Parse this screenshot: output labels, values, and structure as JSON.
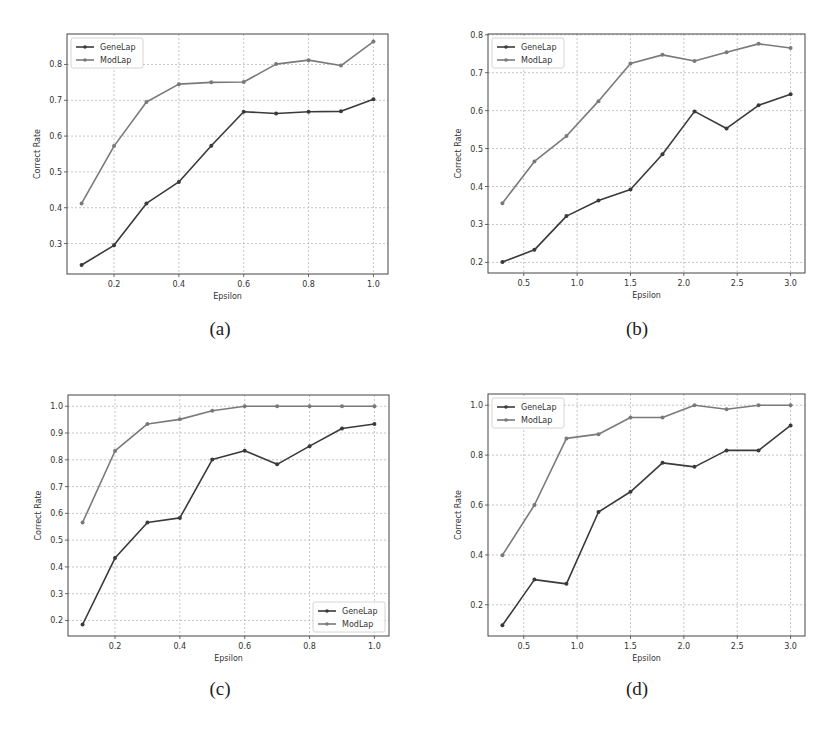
{
  "figure": {
    "captions": [
      "(a)",
      "(b)",
      "(c)",
      "(d)"
    ]
  },
  "colors": {
    "genelap": "#3a3a3a",
    "modlap": "#7a7a7a",
    "grid": "#b8b8b8",
    "frame": "#444444"
  },
  "chart_data": [
    {
      "id": "a",
      "type": "line",
      "caption": "(a)",
      "xlabel": "Epsilon",
      "ylabel": "Correct Rate",
      "xlim": [
        0.055,
        1.045
      ],
      "ylim": [
        0.215,
        0.885
      ],
      "xticks": [
        0.2,
        0.4,
        0.6,
        0.8,
        1.0
      ],
      "xtick_labels": [
        "0.2",
        "0.4",
        "0.6",
        "0.8",
        "1.0"
      ],
      "yticks": [
        0.3,
        0.4,
        0.5,
        0.6,
        0.7,
        0.8
      ],
      "ytick_labels": [
        "0.3",
        "0.4",
        "0.5",
        "0.6",
        "0.7",
        "0.8"
      ],
      "grid": true,
      "legend_position": "upper left",
      "legend": [
        "GeneLap",
        "ModLap"
      ],
      "x": [
        0.1,
        0.2,
        0.3,
        0.4,
        0.5,
        0.6,
        0.7,
        0.8,
        0.9,
        1.0
      ],
      "series": [
        {
          "name": "GeneLap",
          "values": [
            0.24,
            0.295,
            0.412,
            0.472,
            0.573,
            0.668,
            0.663,
            0.668,
            0.669,
            0.703
          ]
        },
        {
          "name": "ModLap",
          "values": [
            0.412,
            0.572,
            0.695,
            0.745,
            0.75,
            0.751,
            0.801,
            0.812,
            0.797,
            0.864
          ]
        }
      ]
    },
    {
      "id": "b",
      "type": "line",
      "caption": "(b)",
      "xlabel": "Epsilon",
      "ylabel": "Correct Rate",
      "xlim": [
        0.165,
        3.135
      ],
      "ylim": [
        0.172,
        0.802
      ],
      "xticks": [
        0.5,
        1.0,
        1.5,
        2.0,
        2.5,
        3.0
      ],
      "xtick_labels": [
        "0.5",
        "1.0",
        "1.5",
        "2.0",
        "2.5",
        "3.0"
      ],
      "yticks": [
        0.2,
        0.3,
        0.4,
        0.5,
        0.6,
        0.7,
        0.8
      ],
      "ytick_labels": [
        "0.2",
        "0.3",
        "0.4",
        "0.5",
        "0.6",
        "0.7",
        "0.8"
      ],
      "grid": true,
      "legend_position": "upper left",
      "legend": [
        "GeneLap",
        "ModLap"
      ],
      "x": [
        0.3,
        0.6,
        0.9,
        1.2,
        1.5,
        1.8,
        2.1,
        2.4,
        2.7,
        3.0
      ],
      "series": [
        {
          "name": "GeneLap",
          "values": [
            0.201,
            0.233,
            0.322,
            0.363,
            0.392,
            0.485,
            0.598,
            0.553,
            0.614,
            0.643
          ]
        },
        {
          "name": "ModLap",
          "values": [
            0.356,
            0.466,
            0.533,
            0.625,
            0.724,
            0.747,
            0.731,
            0.754,
            0.776,
            0.765
          ]
        }
      ]
    },
    {
      "id": "c",
      "type": "line",
      "caption": "(c)",
      "xlabel": "Epsilon",
      "ylabel": "Correct Rate",
      "xlim": [
        0.055,
        1.045
      ],
      "ylim": [
        0.142,
        1.042
      ],
      "xticks": [
        0.2,
        0.4,
        0.6,
        0.8,
        1.0
      ],
      "xtick_labels": [
        "0.2",
        "0.4",
        "0.6",
        "0.8",
        "1.0"
      ],
      "yticks": [
        0.2,
        0.3,
        0.4,
        0.5,
        0.6,
        0.7,
        0.8,
        0.9,
        1.0
      ],
      "ytick_labels": [
        "0.2",
        "0.3",
        "0.4",
        "0.5",
        "0.6",
        "0.7",
        "0.8",
        "0.9",
        "1.0"
      ],
      "grid": true,
      "legend_position": "lower right",
      "legend": [
        "GeneLap",
        "ModLap"
      ],
      "x": [
        0.1,
        0.2,
        0.3,
        0.4,
        0.5,
        0.6,
        0.7,
        0.8,
        0.9,
        1.0
      ],
      "series": [
        {
          "name": "GeneLap",
          "values": [
            0.185,
            0.433,
            0.566,
            0.583,
            0.801,
            0.834,
            0.783,
            0.851,
            0.917,
            0.934
          ]
        },
        {
          "name": "ModLap",
          "values": [
            0.566,
            0.833,
            0.934,
            0.951,
            0.983,
            1.0,
            1.0,
            1.0,
            1.0,
            1.0
          ]
        }
      ]
    },
    {
      "id": "d",
      "type": "line",
      "caption": "(d)",
      "xlabel": "Epsilon",
      "ylabel": "Correct Rate",
      "xlim": [
        0.165,
        3.135
      ],
      "ylim": [
        0.075,
        1.045
      ],
      "xticks": [
        0.5,
        1.0,
        1.5,
        2.0,
        2.5,
        3.0
      ],
      "xtick_labels": [
        "0.5",
        "1.0",
        "1.5",
        "2.0",
        "2.5",
        "3.0"
      ],
      "yticks": [
        0.2,
        0.4,
        0.6,
        0.8,
        1.0
      ],
      "ytick_labels": [
        "0.2",
        "0.4",
        "0.6",
        "0.8",
        "1.0"
      ],
      "grid": true,
      "legend_position": "upper left",
      "legend": [
        "GeneLap",
        "ModLap"
      ],
      "x": [
        0.3,
        0.6,
        0.9,
        1.2,
        1.5,
        1.8,
        2.1,
        2.4,
        2.7,
        3.0
      ],
      "series": [
        {
          "name": "GeneLap",
          "values": [
            0.118,
            0.301,
            0.284,
            0.572,
            0.653,
            0.769,
            0.753,
            0.819,
            0.819,
            0.919
          ]
        },
        {
          "name": "ModLap",
          "values": [
            0.399,
            0.6,
            0.867,
            0.884,
            0.951,
            0.951,
            1.0,
            0.984,
            1.0,
            1.0
          ]
        }
      ]
    }
  ]
}
